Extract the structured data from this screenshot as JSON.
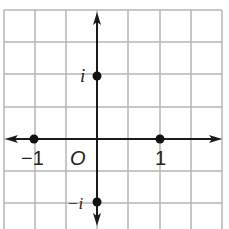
{
  "diagram": {
    "type": "complex-plane",
    "grid": {
      "x_lines": [
        4,
        35,
        66,
        97,
        128,
        160,
        191,
        222
      ],
      "y_lines": [
        10,
        42,
        74,
        107,
        139,
        171,
        203
      ],
      "color": "#b4b4b4"
    },
    "axes": {
      "origin_px": [
        97,
        139
      ],
      "unit_px": 63,
      "color": "#1a1a1a",
      "x_axis": {
        "from": 5,
        "to": 222
      },
      "y_axis": {
        "from": 12,
        "to": 226
      }
    },
    "origin_label": "O",
    "points": [
      {
        "name": "i",
        "label": "i",
        "re": 0,
        "im": 1
      },
      {
        "name": "neg-i",
        "label": "−i",
        "re": 0,
        "im": -1
      },
      {
        "name": "one",
        "label": "1",
        "re": 1,
        "im": 0
      },
      {
        "name": "neg-one",
        "label": "−1",
        "re": -1,
        "im": 0
      }
    ]
  },
  "labels": {
    "i": "i",
    "neg_i": "−i",
    "one": "1",
    "neg_one": "−1",
    "origin": "O"
  }
}
